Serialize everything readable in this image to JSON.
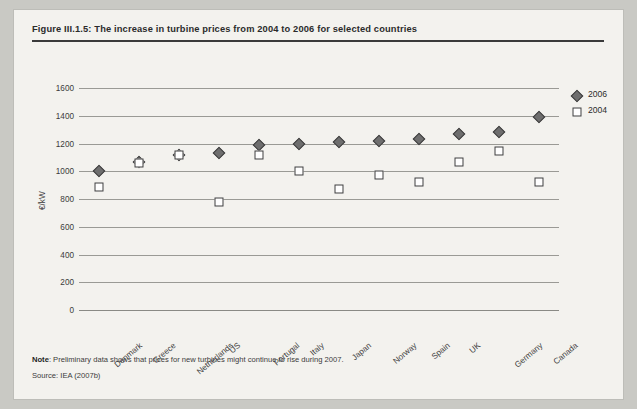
{
  "figure": {
    "title": "Figure III.1.5: The increase in turbine prices from 2004 to 2006 for selected countries"
  },
  "footer": {
    "note_label": "Note",
    "note_text": ": Preliminary data shows that prices for new turbines might continue to rise during 2007.",
    "source": "Source: IEA (2007b)"
  },
  "legend": {
    "position": "right",
    "entries": [
      {
        "label": "2006",
        "marker": "diamond-filled",
        "color": "#6e6e6e"
      },
      {
        "label": "2004",
        "marker": "square-open",
        "color": "#ffffff"
      }
    ]
  },
  "chart_data": {
    "type": "scatter",
    "title": "Figure III.1.5: The increase in turbine prices from 2004 to 2006 for selected countries",
    "xlabel": "",
    "ylabel": "€/kW",
    "ylim": [
      0,
      1600
    ],
    "yticks": [
      0,
      200,
      400,
      600,
      800,
      1000,
      1200,
      1400,
      1600
    ],
    "ytick_labels": [
      "0",
      "200",
      "400",
      "600",
      "800",
      "1000",
      "1200",
      "1400",
      "1600"
    ],
    "grid": true,
    "categories": [
      "Denmark",
      "Greece",
      "Netherlands",
      "US",
      "Portugal",
      "Italy",
      "Japan",
      "Norway",
      "Spain",
      "UK",
      "Germany",
      "Canada"
    ],
    "series": [
      {
        "name": "2006",
        "marker": "diamond-filled",
        "values": [
          1000,
          1070,
          1115,
          1130,
          1190,
          1195,
          1210,
          1215,
          1230,
          1265,
          1285,
          1390
        ]
      },
      {
        "name": "2004",
        "marker": "square-open",
        "values": [
          890,
          1060,
          1120,
          780,
          1120,
          1000,
          870,
          975,
          925,
          1065,
          1145,
          920
        ]
      }
    ]
  }
}
